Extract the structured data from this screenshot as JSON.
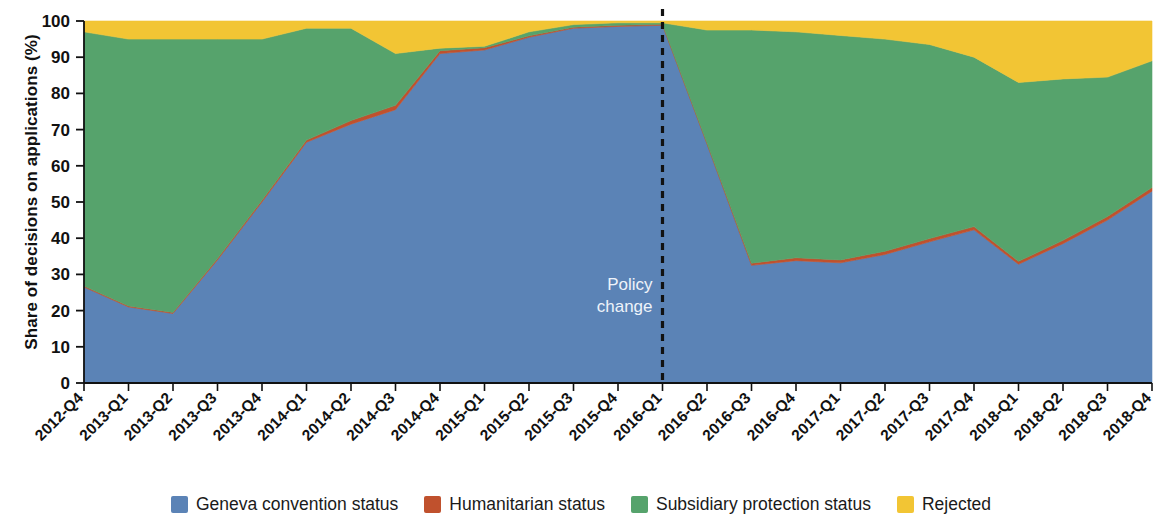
{
  "chart_data": {
    "type": "area",
    "title": "",
    "subtitle": "",
    "xlabel": "",
    "ylabel": "Share of decisions on applications (%)",
    "ylim": [
      0,
      100
    ],
    "yticks": [
      0,
      10,
      20,
      30,
      40,
      50,
      60,
      70,
      80,
      90,
      100
    ],
    "grid": false,
    "stacked": true,
    "legend_position": "bottom",
    "categories": [
      "2012-Q4",
      "2013-Q1",
      "2013-Q2",
      "2013-Q3",
      "2013-Q4",
      "2014-Q1",
      "2014-Q2",
      "2014-Q3",
      "2014-Q4",
      "2015-Q1",
      "2015-Q2",
      "2015-Q3",
      "2015-Q4",
      "2016-Q1",
      "2016-Q2",
      "2016-Q3",
      "2016-Q4",
      "2017-Q1",
      "2017-Q2",
      "2017-Q3",
      "2017-Q4",
      "2018-Q1",
      "2018-Q2",
      "2018-Q3",
      "2018-Q4"
    ],
    "series": [
      {
        "name": "Geneva convention status",
        "color": "#5b83b6",
        "values": [
          26.5,
          21.0,
          19.2,
          34.0,
          50.0,
          66.5,
          71.5,
          75.5,
          91.0,
          92.0,
          95.5,
          98.0,
          98.5,
          98.8,
          66.0,
          32.5,
          33.8,
          33.2,
          35.5,
          39.0,
          42.3,
          32.8,
          38.5,
          45.0,
          53.0
        ]
      },
      {
        "name": "Humanitarian status",
        "color": "#c0512d",
        "values": [
          0.3,
          0.3,
          0.3,
          0.4,
          0.5,
          0.6,
          1.0,
          1.2,
          0.8,
          0.6,
          0.4,
          0.3,
          0.3,
          0.3,
          0.3,
          0.6,
          0.8,
          0.8,
          0.9,
          0.9,
          0.9,
          0.8,
          0.9,
          1.0,
          1.0
        ]
      },
      {
        "name": "Subsidiary protection status",
        "color": "#56a36c",
        "values": [
          70.2,
          73.7,
          75.5,
          60.6,
          44.5,
          30.9,
          25.5,
          14.3,
          0.7,
          0.4,
          1.1,
          0.7,
          0.7,
          0.4,
          31.2,
          64.4,
          62.4,
          62.0,
          58.6,
          53.6,
          46.8,
          49.4,
          44.6,
          38.5,
          35.0
        ]
      },
      {
        "name": "Rejected",
        "color": "#f2c534",
        "values": [
          3.0,
          5.0,
          5.0,
          5.0,
          5.0,
          2.0,
          2.0,
          9.0,
          7.5,
          7.0,
          3.0,
          1.0,
          0.5,
          0.5,
          2.5,
          2.5,
          3.0,
          4.0,
          5.0,
          6.5,
          10.0,
          17.0,
          16.0,
          15.5,
          11.0
        ]
      }
    ],
    "annotations": [
      {
        "name": "policy-change",
        "label_line1": "Policy",
        "label_line2": "change",
        "at_category": "2016-Q1",
        "style": "dashed-vertical",
        "color": "#111111",
        "text_color": "#eef3fa"
      }
    ]
  },
  "legend": {
    "items": [
      {
        "label": "Geneva convention status",
        "color": "#5b83b6"
      },
      {
        "label": "Humanitarian status",
        "color": "#c0512d"
      },
      {
        "label": "Subsidiary protection status",
        "color": "#56a36c"
      },
      {
        "label": "Rejected",
        "color": "#f2c534"
      }
    ]
  },
  "axes": {
    "y_axis_title": "Share of decisions on applications (%)"
  }
}
